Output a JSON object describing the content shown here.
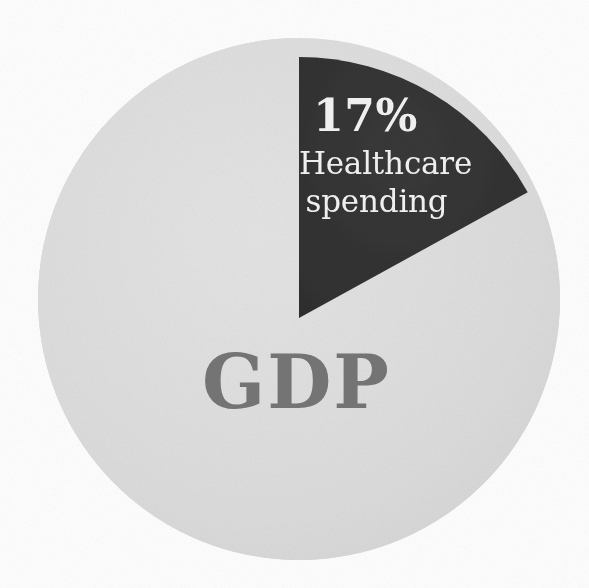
{
  "chart_data": {
    "type": "pie",
    "title": "",
    "subtitle": "",
    "xlabel": "",
    "ylabel": "",
    "legend_position": "none",
    "grid": false,
    "center_label": "GDP",
    "units": "percent of GDP",
    "slices": [
      {
        "name": "Healthcare spending",
        "label_line_1": "Healthcare",
        "label_line_2": "spending",
        "value": 17,
        "value_label": "17%",
        "color": "#333333",
        "label_color": "#f2f2f2",
        "start_angle_deg": 0,
        "end_angle_deg": 61.2,
        "exploded": true
      },
      {
        "name": "Rest of GDP",
        "label_line_1": "GDP",
        "label_line_2": "",
        "value": 83,
        "value_label": "83%",
        "color": "#dcdcdc",
        "label_color": "#757575",
        "start_angle_deg": 61.2,
        "end_angle_deg": 360,
        "exploded": false
      }
    ]
  },
  "figure": {
    "background_color": "#fdfdfd",
    "slice_highlight_color": "#333333",
    "slice_base_color": "#dcdcdc",
    "whole_label_color": "#757575",
    "callout_text_color": "#f2f2f2"
  },
  "labels": {
    "percent": "17%",
    "category_line_1": "Healthcare",
    "category_line_2": "spending",
    "whole": "GDP"
  }
}
